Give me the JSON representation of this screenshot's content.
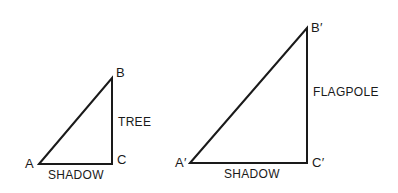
{
  "figure": {
    "left_triangle": {
      "vertices": {
        "A": "A",
        "B": "B",
        "C": "C"
      },
      "vertical_side_label": "TREE",
      "base_label": "SHADOW"
    },
    "right_triangle": {
      "vertices": {
        "A": "A′",
        "B": "B′",
        "C": "C′"
      },
      "vertical_side_label": "FLAGPOLE",
      "base_label": "SHADOW"
    },
    "stroke_color": "#1a1a1a"
  }
}
